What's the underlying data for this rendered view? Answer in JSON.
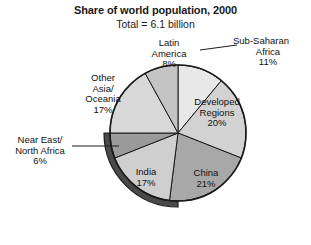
{
  "chart": {
    "title": "Share of world population, 2000",
    "subtitle": "Total = 6.1 billion"
  },
  "chart_data": {
    "type": "pie",
    "title": "Share of world population, 2000",
    "subtitle": "Total = 6.1 billion",
    "total_label": "Total = 6.1 billion",
    "total_value": 6.1,
    "total_units": "billion",
    "xlabel": "",
    "ylabel": "",
    "legend": "none",
    "grid": false,
    "start_angle_deg": 0,
    "direction": "clockwise",
    "categories": [
      "Sub-Saharan Africa",
      "Developed Regions",
      "China",
      "India",
      "Near East/ North Africa",
      "Other Asia/ Oceania",
      "Latin America"
    ],
    "values": [
      11,
      20,
      21,
      17,
      6,
      17,
      8
    ],
    "slices": [
      {
        "name": "Sub-Saharan Africa",
        "label_line1": "Sub-Saharan",
        "label_line2": "Africa",
        "percent_text": "11%",
        "value": 11,
        "color": "#e8e8e8",
        "label_placement": "outside-right",
        "leader_line": true
      },
      {
        "name": "Developed Regions",
        "label_line1": "Developed",
        "label_line2": "Regions",
        "percent_text": "20%",
        "value": 20,
        "color": "#d2d2d2",
        "label_placement": "inside",
        "leader_line": false
      },
      {
        "name": "China",
        "label_line1": "China",
        "label_line2": "",
        "percent_text": "21%",
        "value": 21,
        "color": "#a8a8a8",
        "label_placement": "inside",
        "leader_line": false
      },
      {
        "name": "India",
        "label_line1": "India",
        "label_line2": "",
        "percent_text": "17%",
        "value": 17,
        "color": "#cfcfcf",
        "label_placement": "inside",
        "leader_line": false
      },
      {
        "name": "Near East/ North Africa",
        "label_line1": "Near East/",
        "label_line2": "North Africa",
        "percent_text": "6%",
        "value": 6,
        "color": "#9a9a9a",
        "label_placement": "outside-left",
        "leader_line": true
      },
      {
        "name": "Other Asia/ Oceania",
        "label_line1": "Other",
        "label_line2": "Asia/",
        "label_line3": "Oceania",
        "percent_text": "17%",
        "value": 17,
        "color": "#d8d8d8",
        "label_placement": "inside",
        "leader_line": false
      },
      {
        "name": "Latin America",
        "label_line1": "Latin",
        "label_line2": "America",
        "percent_text": "8%",
        "value": 8,
        "color": "#c4c4c4",
        "label_placement": "inside",
        "leader_line": false
      }
    ],
    "colors": {
      "outline": "#1a1a1a",
      "rim_shadow": "#4a4a4a",
      "text": "#111111",
      "background": "#ffffff"
    }
  }
}
